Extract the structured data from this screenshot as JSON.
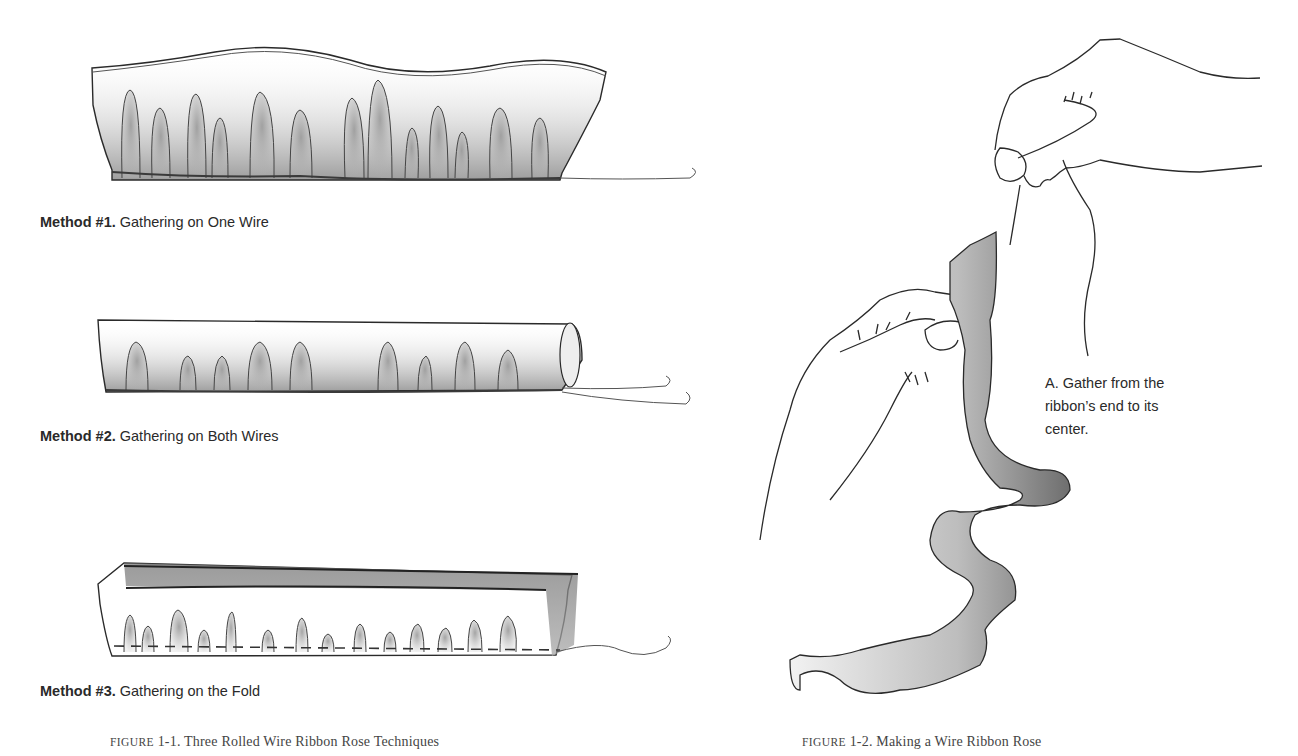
{
  "figure_1_1": {
    "methods": [
      {
        "label": "Method #1.",
        "text": "Gathering on One Wire"
      },
      {
        "label": "Method #2.",
        "text": "Gathering on Both Wires"
      },
      {
        "label": "Method #3.",
        "text": "Gathering on the Fold"
      }
    ],
    "caption_prefix": "FIGURE",
    "caption_rest": "1-1. Three Rolled Wire Ribbon Rose Techniques"
  },
  "figure_1_2": {
    "note_lines": [
      "A. Gather from the",
      "ribbon’s end to its",
      "center."
    ],
    "caption_prefix": "FIGURE",
    "caption_rest": "1-2. Making a Wire Ribbon Rose"
  },
  "colors": {
    "ink": "#2a2a2a",
    "shade": "#8a8a8a",
    "caption": "#444444"
  }
}
